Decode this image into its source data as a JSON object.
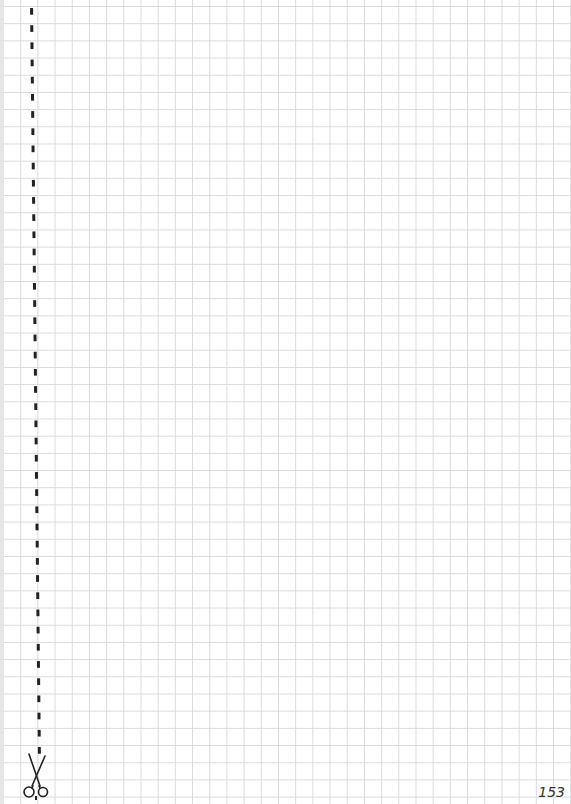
{
  "page": {
    "type": "grid-paper",
    "page_number": "153",
    "grid_color": "#dadada",
    "cut_line_color": "#222222",
    "icons": {
      "scissors": "scissors-icon"
    }
  }
}
